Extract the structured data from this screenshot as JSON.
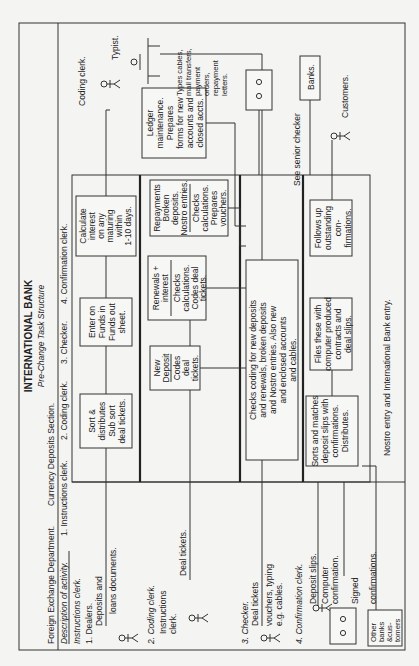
{
  "header": {
    "title": "INTERNATIONAL BANK",
    "subtitle": "Pre-Change Task Structure",
    "department": "Foreign Exchange Department.",
    "section": "Currency Deposits Section.",
    "description_label": "Description of activity.",
    "columns": [
      "1. Instructions clerk.",
      "2. Coding clerk.",
      "3. Checker.",
      "4. Confirmation clerk."
    ]
  },
  "left_panel": {
    "instructions_clerk": "Instructions clerk.",
    "dealers": "1. Dealers.",
    "dealers_doc_1": "Deposits and",
    "dealers_doc_2": "loans documents.",
    "coding_clerk": "2. Coding clerk.",
    "coding_from_1": "Instructions",
    "coding_from_2": "clerk.",
    "coding_doc": "Deal tickets.",
    "checker": "3. Checker.",
    "checker_doc_1": "Deal tickets",
    "checker_doc_2": "vouchers, typing",
    "checker_doc_3": "e.g. cables.",
    "confirmation_clerk": "4. Confirmation clerk.",
    "conf_doc_1": "Deposit slips.",
    "conf_doc_2": "Computer",
    "conf_doc_3": "confirmation.",
    "conf_doc_4": "Signed",
    "conf_doc_5": "confirmations.",
    "other_banks": [
      "Other",
      "banks",
      "&cus-",
      "tomers"
    ]
  },
  "boxes": {
    "sort": [
      "Sort &",
      "distributes",
      "Sub sort",
      "deal tickets."
    ],
    "funds": [
      "Enter on",
      "Funds in",
      "Funds out",
      "sheet."
    ],
    "calc": [
      "Calculate",
      "interest",
      "on any",
      "maturing",
      "within",
      "1-10 days."
    ],
    "new_deposit_head": [
      "New",
      "Deposit"
    ],
    "new_deposit_body": [
      "Codes",
      "deal",
      "tickets."
    ],
    "renewals_head": [
      "Renewals +",
      "interest"
    ],
    "renewals_body": [
      "Checks",
      "calculations.",
      "Codes deal",
      "tickets."
    ],
    "repay_head": [
      "Repayments",
      "Broken",
      "deposits.",
      "Nostro entries."
    ],
    "repay_body": [
      "Checks",
      "calculations.",
      "Prepares",
      "vouchers."
    ],
    "ledger": [
      "Ledger",
      "maintenance.",
      "Prepares",
      "forms for new",
      "accounts and",
      "closed accts."
    ],
    "checks_coding": [
      "Checks coding for new deposits",
      "and renewals, broken deposits",
      "and Nostro entries. Also new",
      "and enclosed accounts",
      "and cables."
    ],
    "sorts_matches": [
      "Sorts and matches",
      "deposit slips with",
      "confirmations.",
      "Distributes."
    ],
    "files": [
      "Files these with",
      "computer produced",
      "contracts and",
      "deal slips."
    ],
    "follows": [
      "Follows up",
      "outstanding",
      "con-",
      "firmations."
    ]
  },
  "right_side": {
    "coding_clerk": "Coding clerk.",
    "typist": "Typist.",
    "typist_desc": [
      "Types cables,",
      "mail transfers,",
      "payment",
      "orders,",
      "repayment",
      "letters."
    ],
    "banks": "Banks.",
    "customers": "Customers."
  },
  "notes": {
    "senior_checker": "See senior checker",
    "nostro": "Nostro entry and International Bank entry."
  }
}
